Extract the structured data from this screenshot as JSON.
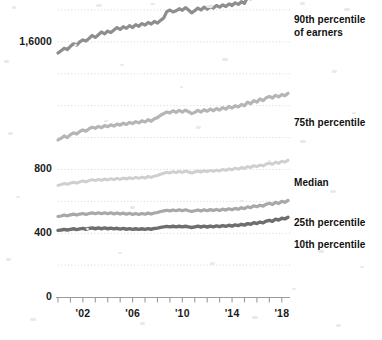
{
  "chart_data": {
    "type": "line",
    "title": "",
    "subtitle": "",
    "xlabel": "",
    "ylabel": "",
    "grid": true,
    "legend_position": "right-inline",
    "ylim": [
      0,
      1800
    ],
    "yticks": [
      0,
      400,
      800,
      1600
    ],
    "ytick_labels": [
      "0",
      "400",
      "800",
      "1,6000"
    ],
    "xlim": [
      2000,
      2019
    ],
    "xticks": [
      2002,
      2006,
      2010,
      2014,
      2018
    ],
    "xtick_labels": [
      "'02",
      "'06",
      "'10",
      "'14",
      "'18"
    ],
    "x": [
      2000.0,
      2000.25,
      2000.5,
      2000.75,
      2001.0,
      2001.25,
      2001.5,
      2001.75,
      2002.0,
      2002.25,
      2002.5,
      2002.75,
      2003.0,
      2003.25,
      2003.5,
      2003.75,
      2004.0,
      2004.25,
      2004.5,
      2004.75,
      2005.0,
      2005.25,
      2005.5,
      2005.75,
      2006.0,
      2006.25,
      2006.5,
      2006.75,
      2007.0,
      2007.25,
      2007.5,
      2007.75,
      2008.0,
      2008.25,
      2008.5,
      2008.75,
      2009.0,
      2009.25,
      2009.5,
      2009.75,
      2010.0,
      2010.25,
      2010.5,
      2010.75,
      2011.0,
      2011.25,
      2011.5,
      2011.75,
      2012.0,
      2012.25,
      2012.5,
      2012.75,
      2013.0,
      2013.25,
      2013.5,
      2013.75,
      2014.0,
      2014.25,
      2014.5,
      2014.75,
      2015.0,
      2015.25,
      2015.5,
      2015.75,
      2016.0,
      2016.25,
      2016.5,
      2016.75,
      2017.0,
      2017.25,
      2017.5,
      2017.75,
      2018.0,
      2018.25,
      2018.5
    ],
    "series": [
      {
        "name": "90th percentile of earners",
        "label": "90th percentile\nof earners",
        "color": "#8e8e8e",
        "values": [
          1530,
          1545,
          1560,
          1552,
          1572,
          1588,
          1580,
          1600,
          1612,
          1605,
          1622,
          1640,
          1628,
          1645,
          1662,
          1650,
          1668,
          1658,
          1675,
          1690,
          1678,
          1695,
          1685,
          1702,
          1690,
          1708,
          1698,
          1715,
          1705,
          1722,
          1712,
          1728,
          1718,
          1735,
          1750,
          1790,
          1800,
          1788,
          1795,
          1808,
          1798,
          1815,
          1800,
          1782,
          1796,
          1812,
          1800,
          1818,
          1805,
          1822,
          1812,
          1828,
          1818,
          1832,
          1822,
          1838,
          1828,
          1845,
          1835,
          1852,
          1842,
          1880,
          1870,
          1892,
          1880,
          1900,
          1888,
          1908,
          1920,
          1900,
          1930,
          1915,
          1945,
          1928,
          1952
        ]
      },
      {
        "name": "75th percentile",
        "label": "75th percentile",
        "color": "#b5b5b5",
        "values": [
          985,
          995,
          1010,
          1000,
          1018,
          1030,
          1022,
          1038,
          1048,
          1040,
          1055,
          1065,
          1058,
          1070,
          1062,
          1075,
          1068,
          1080,
          1072,
          1085,
          1078,
          1090,
          1082,
          1095,
          1088,
          1100,
          1092,
          1105,
          1098,
          1112,
          1102,
          1118,
          1125,
          1140,
          1150,
          1160,
          1155,
          1168,
          1158,
          1170,
          1160,
          1172,
          1162,
          1150,
          1158,
          1170,
          1160,
          1175,
          1165,
          1178,
          1168,
          1182,
          1172,
          1188,
          1178,
          1195,
          1185,
          1200,
          1192,
          1208,
          1200,
          1222,
          1212,
          1232,
          1222,
          1242,
          1232,
          1250,
          1258,
          1248,
          1265,
          1255,
          1270,
          1262,
          1278
        ]
      },
      {
        "name": "Median",
        "label": "Median",
        "color": "#cfcfcf",
        "values": [
          700,
          705,
          712,
          706,
          714,
          720,
          714,
          722,
          728,
          722,
          730,
          736,
          730,
          738,
          732,
          740,
          734,
          742,
          736,
          744,
          738,
          746,
          740,
          748,
          742,
          750,
          744,
          752,
          746,
          756,
          750,
          758,
          762,
          770,
          776,
          782,
          778,
          786,
          780,
          788,
          782,
          790,
          784,
          778,
          784,
          790,
          784,
          792,
          786,
          794,
          788,
          796,
          790,
          800,
          794,
          804,
          798,
          808,
          802,
          812,
          806,
          818,
          812,
          824,
          818,
          828,
          822,
          834,
          840,
          832,
          846,
          838,
          852,
          846,
          858
        ]
      },
      {
        "name": "25th percentile",
        "label": "25th percentile",
        "color": "#a8a8a8",
        "values": [
          505,
          508,
          514,
          509,
          515,
          520,
          514,
          520,
          524,
          518,
          524,
          528,
          522,
          528,
          522,
          528,
          522,
          528,
          521,
          527,
          520,
          526,
          519,
          525,
          518,
          524,
          518,
          524,
          519,
          526,
          520,
          527,
          530,
          536,
          540,
          544,
          540,
          546,
          541,
          547,
          541,
          547,
          541,
          536,
          541,
          546,
          540,
          547,
          541,
          548,
          542,
          549,
          543,
          551,
          545,
          553,
          547,
          556,
          550,
          560,
          554,
          566,
          560,
          572,
          566,
          576,
          570,
          582,
          588,
          580,
          594,
          586,
          600,
          594,
          606
        ]
      },
      {
        "name": "10th percentile",
        "label": "10th percentile",
        "color": "#6e6e6e",
        "values": [
          418,
          420,
          424,
          420,
          424,
          428,
          423,
          427,
          430,
          425,
          430,
          433,
          428,
          433,
          428,
          433,
          428,
          432,
          427,
          431,
          426,
          430,
          425,
          429,
          424,
          428,
          424,
          428,
          424,
          429,
          425,
          430,
          432,
          437,
          440,
          443,
          440,
          444,
          440,
          444,
          440,
          444,
          440,
          436,
          440,
          444,
          439,
          444,
          439,
          445,
          440,
          446,
          441,
          448,
          443,
          450,
          445,
          452,
          448,
          456,
          451,
          460,
          456,
          466,
          461,
          470,
          465,
          476,
          481,
          475,
          488,
          482,
          494,
          490,
          500
        ]
      }
    ],
    "gridlines": [
      1800,
      1600,
      1400,
      1200,
      1000,
      800,
      600,
      400,
      200
    ],
    "axis_color": "#9a9a9a",
    "grid_color": "#d8d8d8",
    "text_color": "#1a1a1a"
  }
}
